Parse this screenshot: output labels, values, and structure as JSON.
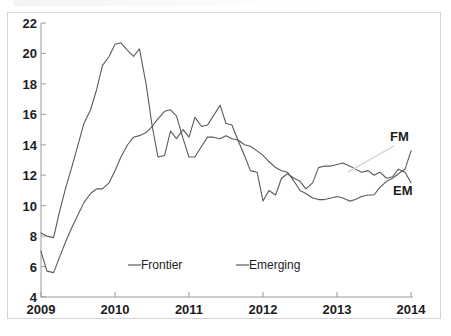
{
  "figure": {
    "background_color": "#ffffff",
    "frame_color": "#d5d5d5",
    "line_color": "#5a5a5a",
    "leader_color": "#cfcfcf"
  },
  "annotations": {
    "fm_label": "FM",
    "em_label": "EM"
  },
  "legend": {
    "items": [
      {
        "label": "Frontier"
      },
      {
        "label": "Emerging"
      }
    ]
  },
  "axis": {
    "y_ticks": [
      "22",
      "20",
      "18",
      "16",
      "14",
      "12",
      "10",
      "8",
      "6",
      "4"
    ],
    "x_ticks": [
      "2009",
      "2010",
      "2011",
      "2012",
      "2013",
      "2014"
    ]
  },
  "chart_data": {
    "type": "line",
    "title": "",
    "subtitle": "",
    "xlabel": "",
    "ylabel": "",
    "xlim": [
      2009.0,
      2014.0
    ],
    "ylim": [
      4,
      22
    ],
    "grid": false,
    "legend_position": "inside-bottom",
    "x_tick_values": [
      2009,
      2010,
      2011,
      2012,
      2013,
      2014
    ],
    "y_tick_values": [
      4,
      6,
      8,
      10,
      12,
      14,
      16,
      18,
      20,
      22
    ],
    "x_label_texts": [
      "2009",
      "2010",
      "2011",
      "2012",
      "2013",
      "2014"
    ],
    "y_label_texts": [
      "4",
      "6",
      "8",
      "10",
      "12",
      "14",
      "16",
      "18",
      "20",
      "22"
    ],
    "annotations": [
      {
        "text": "FM",
        "x": 2013.82,
        "y": 15.0,
        "points_to_series": "Frontier"
      },
      {
        "text": "EM",
        "x": 2013.85,
        "y": 11.4,
        "points_to_series": "Emerging"
      }
    ],
    "series": [
      {
        "name": "Frontier",
        "end_label": "FM",
        "color": "#5a5a5a",
        "x": [
          2009.0,
          2009.08,
          2009.17,
          2009.25,
          2009.33,
          2009.42,
          2009.5,
          2009.58,
          2009.67,
          2009.75,
          2009.83,
          2009.92,
          2010.0,
          2010.08,
          2010.17,
          2010.25,
          2010.33,
          2010.42,
          2010.5,
          2010.58,
          2010.67,
          2010.75,
          2010.83,
          2010.92,
          2011.0,
          2011.08,
          2011.17,
          2011.25,
          2011.33,
          2011.42,
          2011.5,
          2011.58,
          2011.67,
          2011.75,
          2011.83,
          2011.92,
          2012.0,
          2012.08,
          2012.17,
          2012.25,
          2012.33,
          2012.42,
          2012.5,
          2012.58,
          2012.67,
          2012.75,
          2012.83,
          2012.92,
          2013.0,
          2013.08,
          2013.17,
          2013.25,
          2013.33,
          2013.42,
          2013.5,
          2013.58,
          2013.67,
          2013.75,
          2013.83,
          2013.92,
          2014.0
        ],
        "y": [
          7.0,
          5.7,
          5.6,
          6.6,
          7.6,
          8.6,
          9.4,
          10.2,
          10.8,
          11.1,
          11.1,
          11.5,
          12.3,
          13.2,
          14.0,
          14.5,
          14.6,
          14.8,
          15.2,
          15.7,
          16.2,
          16.3,
          15.9,
          14.4,
          13.2,
          13.2,
          13.9,
          14.5,
          14.5,
          14.4,
          14.6,
          14.4,
          14.3,
          14.0,
          13.9,
          13.6,
          13.3,
          12.9,
          12.5,
          12.3,
          12.2,
          11.6,
          11.0,
          10.8,
          10.5,
          10.4,
          10.4,
          10.5,
          10.6,
          10.5,
          10.3,
          10.4,
          10.6,
          10.7,
          10.7,
          11.2,
          11.6,
          11.8,
          12.1,
          12.4,
          13.6
        ]
      },
      {
        "name": "Emerging",
        "end_label": "EM",
        "color": "#5a5a5a",
        "x": [
          2009.0,
          2009.08,
          2009.17,
          2009.25,
          2009.33,
          2009.42,
          2009.5,
          2009.58,
          2009.67,
          2009.75,
          2009.83,
          2009.92,
          2010.0,
          2010.08,
          2010.17,
          2010.25,
          2010.33,
          2010.42,
          2010.5,
          2010.58,
          2010.67,
          2010.75,
          2010.83,
          2010.92,
          2011.0,
          2011.08,
          2011.17,
          2011.25,
          2011.33,
          2011.42,
          2011.5,
          2011.58,
          2011.67,
          2011.75,
          2011.83,
          2011.92,
          2012.0,
          2012.08,
          2012.17,
          2012.25,
          2012.33,
          2012.42,
          2012.5,
          2012.58,
          2012.67,
          2012.75,
          2012.83,
          2012.92,
          2013.0,
          2013.08,
          2013.17,
          2013.25,
          2013.33,
          2013.42,
          2013.5,
          2013.58,
          2013.67,
          2013.75,
          2013.83,
          2013.92,
          2014.0
        ],
        "y": [
          8.2,
          8.0,
          7.9,
          9.6,
          11.1,
          12.6,
          14.0,
          15.4,
          16.3,
          17.6,
          19.2,
          19.8,
          20.6,
          20.7,
          20.2,
          19.8,
          20.3,
          18.0,
          15.3,
          13.2,
          13.3,
          14.9,
          14.4,
          15.0,
          14.5,
          15.8,
          15.2,
          15.3,
          15.9,
          16.6,
          15.4,
          15.3,
          14.2,
          13.3,
          12.3,
          12.2,
          10.3,
          11.0,
          10.7,
          11.8,
          12.1,
          11.8,
          11.6,
          11.1,
          11.5,
          12.5,
          12.6,
          12.6,
          12.7,
          12.8,
          12.6,
          12.4,
          12.2,
          12.3,
          12.0,
          12.2,
          11.8,
          11.9,
          12.4,
          12.2,
          11.5
        ]
      }
    ]
  }
}
